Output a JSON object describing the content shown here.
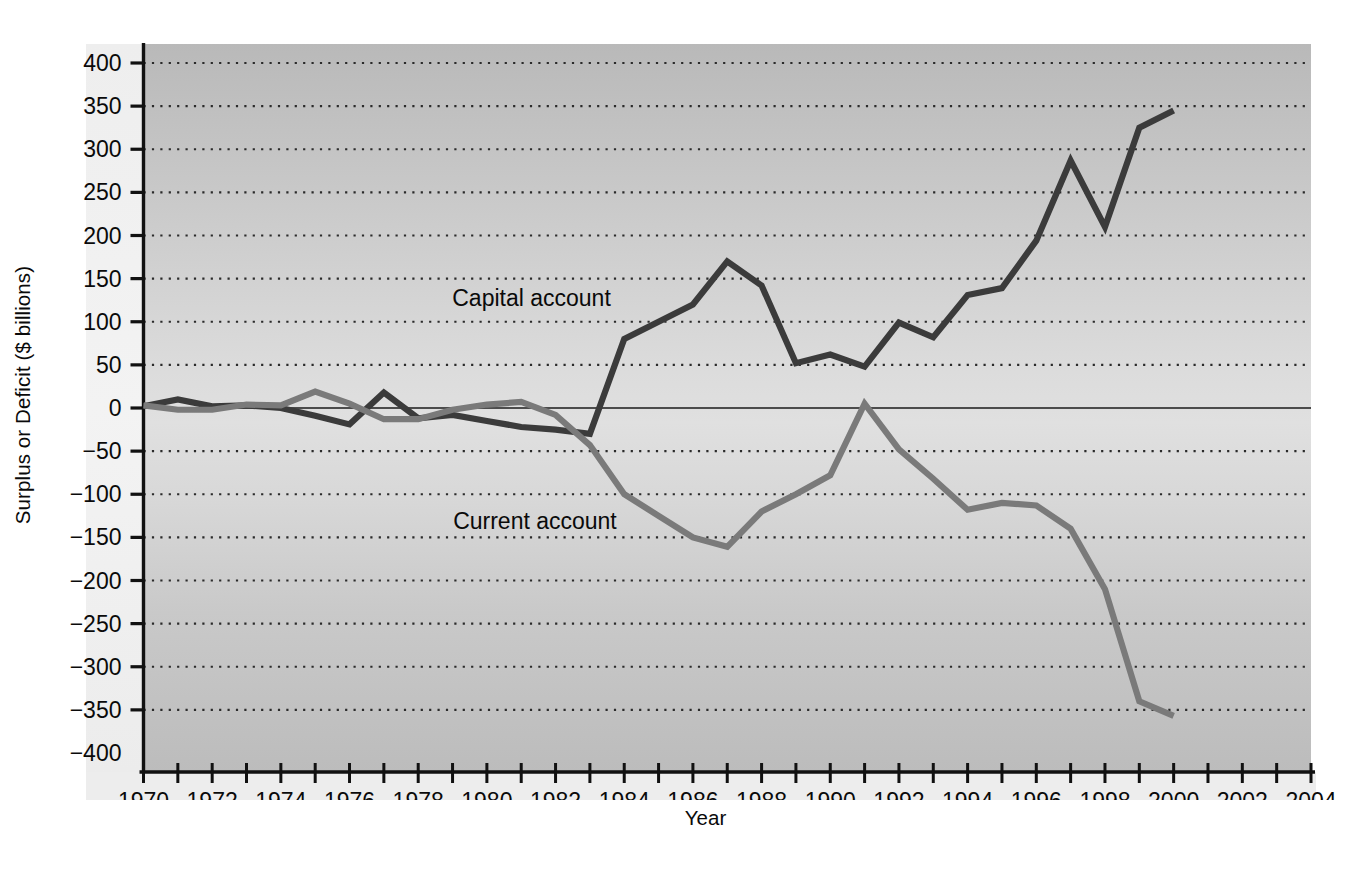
{
  "chart_data": {
    "type": "line",
    "title": "",
    "xlabel": "Year",
    "ylabel": "Surplus or Deficit ($ billions)",
    "xlim": [
      1970,
      2004
    ],
    "ylim": [
      -400,
      400
    ],
    "grid": true,
    "legend_position": "inline-annotation",
    "x_tick_step": 1,
    "x_label_step": 2,
    "y_tick_step": 50,
    "x_tick_labels": [
      "1970",
      "1972",
      "1974",
      "1976",
      "1978",
      "1980",
      "1982",
      "1984",
      "1986",
      "1988",
      "1990",
      "1992",
      "1994",
      "1996",
      "1998",
      "2000",
      "2002",
      "2004"
    ],
    "y_tick_labels": [
      "400",
      "350",
      "300",
      "250",
      "200",
      "150",
      "100",
      "50",
      "0",
      "−50",
      "−100",
      "−150",
      "−200",
      "−250",
      "−300",
      "−350",
      "−400"
    ],
    "x": [
      1970,
      1971,
      1972,
      1973,
      1974,
      1975,
      1976,
      1977,
      1978,
      1979,
      1980,
      1981,
      1982,
      1983,
      1984,
      1985,
      1986,
      1987,
      1988,
      1989,
      1990,
      1991,
      1992,
      1993,
      1994,
      1995,
      1996,
      1997,
      1998,
      1999,
      2000
    ],
    "series": [
      {
        "name": "Capital account",
        "color": "#3b3b3b",
        "annotation": "Capital account",
        "annotation_x": 1981.3,
        "annotation_y": 118,
        "values": [
          2,
          10,
          2,
          3,
          0,
          -9,
          -19,
          18,
          -12,
          -8,
          -15,
          -22,
          -25,
          -30,
          80,
          100,
          120,
          170,
          142,
          52,
          62,
          48,
          99,
          82,
          131,
          139,
          194,
          287,
          210,
          325,
          345
        ]
      },
      {
        "name": "Current account",
        "color": "#7a7a7a",
        "annotation": "Current account",
        "annotation_x": 1981.4,
        "annotation_y": -140,
        "values": [
          3,
          -2,
          -2,
          4,
          3,
          19,
          5,
          -13,
          -13,
          -2,
          4,
          7,
          -8,
          -43,
          -100,
          -125,
          -150,
          -161,
          -120,
          -100,
          -78,
          5,
          -48,
          -82,
          -118,
          -110,
          -113,
          -140,
          -210,
          -340,
          -357
        ]
      }
    ]
  }
}
